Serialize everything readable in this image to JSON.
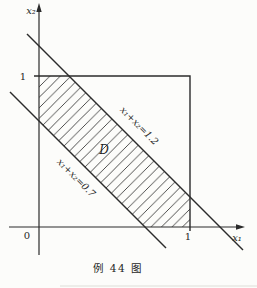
{
  "figure": {
    "caption": "例 44 图",
    "axes": {
      "x_axis_label": "x₁",
      "y_axis_label": "x₂",
      "origin_label": "0",
      "x_tick_label": "1",
      "y_tick_label": "1"
    },
    "boundary_lines": [
      {
        "label": "x₁+x₂=1.2"
      },
      {
        "label": "x₁+x₂=0.7"
      }
    ],
    "region": {
      "label": "D"
    },
    "colors": {
      "ink": "#2b2b2b",
      "paper": "#fcfcfa"
    }
  }
}
